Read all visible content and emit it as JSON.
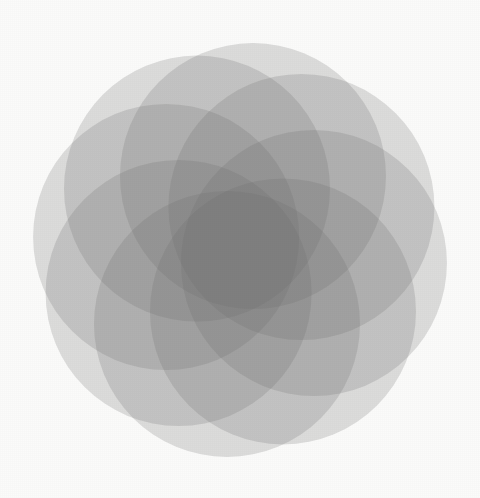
{
  "figure": {
    "shape_kind": "circle-rosette",
    "background_color": "#fbfbfa",
    "canvas": {
      "width": 480,
      "height": 498
    }
  },
  "palette": {
    "circle_fill": "#6f6f6f",
    "circle_opacity": 0.22,
    "darkest_core": "#6e6e6e",
    "lightest_single_layer": "#d9d9d9",
    "background": "#fbfbfa",
    "stroke": "none"
  },
  "geometry": {
    "center_x": 240,
    "center_y": 250,
    "petal_count": 8,
    "circle_radius": 133,
    "offset_radius": 75,
    "start_angle_deg": -80,
    "bounding_box": {
      "left": 33,
      "top": 42,
      "right": 447,
      "bottom": 460
    },
    "note": "Each circle center sits at offset_radius from the rosette center, rotated evenly by 360/petal_count degrees"
  },
  "circles": [
    {
      "label": "petal-1",
      "angle_deg": -80,
      "cx": 253.0,
      "cy": 176.1,
      "r": 133
    },
    {
      "label": "petal-2",
      "angle_deg": -35,
      "cx": 301.4,
      "cy": 207.0,
      "r": 133
    },
    {
      "label": "petal-3",
      "angle_deg": 10,
      "cx": 313.9,
      "cy": 263.0,
      "r": 133
    },
    {
      "label": "petal-4",
      "angle_deg": 55,
      "cx": 283.0,
      "cy": 311.4,
      "r": 133
    },
    {
      "label": "petal-5",
      "angle_deg": 100,
      "cx": 227.0,
      "cy": 323.9,
      "r": 133
    },
    {
      "label": "petal-6",
      "angle_deg": 145,
      "cx": 178.6,
      "cy": 293.0,
      "r": 133
    },
    {
      "label": "petal-7",
      "angle_deg": 190,
      "cx": 166.1,
      "cy": 237.0,
      "r": 133
    },
    {
      "label": "petal-8",
      "angle_deg": 235,
      "cx": 197.0,
      "cy": 188.6,
      "r": 133
    }
  ],
  "chart_data": {
    "type": "scatter",
    "subtitle": "",
    "xlabel": "",
    "ylabel": "",
    "xlim": [
      0,
      480
    ],
    "ylim": [
      0,
      498
    ],
    "grid": false,
    "legend": "none",
    "series": [
      {
        "name": "circle centers",
        "marker": "circle",
        "radius": 133,
        "fill": "#6f6f6f",
        "alpha": 0.22,
        "x": [
          253.0,
          301.4,
          313.9,
          283.0,
          227.0,
          178.6,
          166.1,
          197.0
        ],
        "y": [
          176.1,
          207.0,
          263.0,
          311.4,
          323.9,
          293.0,
          237.0,
          188.6
        ]
      }
    ],
    "annotations": []
  }
}
